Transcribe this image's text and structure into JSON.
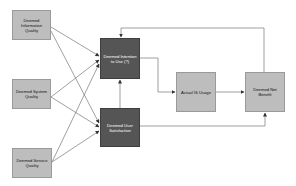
{
  "diagram": {
    "colors": {
      "light_box": "#bdbdbd",
      "dark_box": "#555555",
      "line": "#777777",
      "background": "#ffffff"
    },
    "nodes": {
      "info_quality": {
        "label": "Deemed Information Quality"
      },
      "system_quality": {
        "label": "Deemed System Quality"
      },
      "service_quality": {
        "label": "Deemed Service Quality"
      },
      "intention_to_use": {
        "label": "Deemed Intention to Use (?)"
      },
      "user_satisfaction": {
        "label": "Deemed User Satisfaction"
      },
      "actual_usage": {
        "label": "Actual IS Usage"
      },
      "net_benefit": {
        "label": "Deemed Net Benefit"
      }
    },
    "edges": [
      {
        "from": "info_quality",
        "to": "intention_to_use"
      },
      {
        "from": "info_quality",
        "to": "user_satisfaction"
      },
      {
        "from": "system_quality",
        "to": "intention_to_use"
      },
      {
        "from": "system_quality",
        "to": "user_satisfaction"
      },
      {
        "from": "service_quality",
        "to": "intention_to_use"
      },
      {
        "from": "service_quality",
        "to": "user_satisfaction"
      },
      {
        "from": "user_satisfaction",
        "to": "intention_to_use"
      },
      {
        "from": "intention_to_use",
        "to": "actual_usage"
      },
      {
        "from": "actual_usage",
        "to": "net_benefit"
      },
      {
        "from": "user_satisfaction",
        "to": "net_benefit"
      },
      {
        "from": "net_benefit",
        "to": "intention_to_use"
      }
    ]
  }
}
